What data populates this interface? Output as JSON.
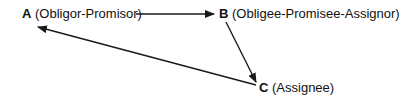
{
  "diagram": {
    "type": "assignment-relationship",
    "nodes": [
      {
        "id": "A",
        "letter": "A",
        "role": "(Obligor-Promisor)"
      },
      {
        "id": "B",
        "letter": "B",
        "role": "(Obligee-Promisee-Assignor)"
      },
      {
        "id": "C",
        "letter": "C",
        "role": "(Assignee)"
      }
    ],
    "edges": [
      {
        "from": "A",
        "to": "B"
      },
      {
        "from": "B",
        "to": "C"
      },
      {
        "from": "C",
        "to": "A"
      }
    ],
    "colors": {
      "line": "#1a1a1a",
      "text": "#111111",
      "background": "#ffffff"
    }
  }
}
